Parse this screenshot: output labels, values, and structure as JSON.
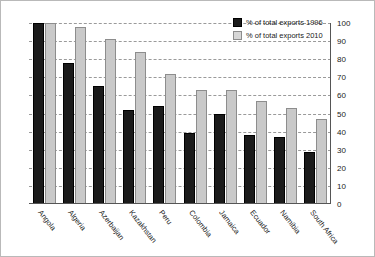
{
  "chart_data": {
    "type": "bar",
    "title": "",
    "xlabel": "",
    "ylabel": "",
    "ylim": [
      0,
      100
    ],
    "ytick_step": 10,
    "yticks": [
      100,
      90,
      80,
      70,
      60,
      50,
      40,
      30,
      20,
      10,
      0
    ],
    "grid": true,
    "yaxis_position": "right",
    "legend_position": "top-right",
    "categories": [
      "Angola",
      "Algeria",
      "Azerbaijan",
      "Kazakhstan",
      "Peru",
      "Colombia",
      "Jamaica",
      "Ecuador",
      "Namibia",
      "South Africa"
    ],
    "series": [
      {
        "name": "% of total exports 1996",
        "color": "#1b1b1b",
        "values": [
          100,
          78,
          65,
          52,
          54,
          39,
          50,
          38,
          37,
          29
        ]
      },
      {
        "name": "% of total exports 2010",
        "color": "#c9c9c9",
        "values": [
          100,
          98,
          91,
          84,
          72,
          63,
          63,
          57,
          53,
          47
        ]
      }
    ]
  },
  "legend": {
    "items": [
      {
        "label": "% of total exports 1996",
        "swatch": "s1996"
      },
      {
        "label": "% of total exports 2010",
        "swatch": "s2010"
      }
    ]
  }
}
